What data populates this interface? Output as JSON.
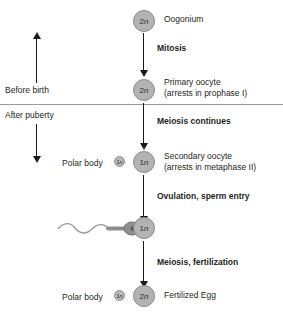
{
  "diagram": {
    "background": "#ffffff",
    "cell_fill": "#b3b3b3",
    "cell_stroke": "#8a8a8a",
    "arrow_color": "#1a1a1a",
    "divider_color": "#9b9b9b"
  },
  "phases": {
    "before_birth": "Before birth",
    "after_puberty": "After puberty"
  },
  "steps": {
    "mitosis": "Mitosis",
    "meiosis_continues": "Meiosis continues",
    "ovulation": "Ovulation, sperm entry",
    "meiosis_fertilization": "Meiosis, fertilization"
  },
  "cells": {
    "oogonium": {
      "ploidy": "2n",
      "name": "Oogonium",
      "note": ""
    },
    "primary_oocyte": {
      "ploidy": "2n",
      "name": "Primary oocyte",
      "note": "(arrests in prophase I)"
    },
    "secondary_oocyte": {
      "ploidy": "1n",
      "name": "Secondary oocyte",
      "note": "(arrests in metaphase II)"
    },
    "fertilized_oocyte": {
      "ploidy": "1n",
      "name": "",
      "note": ""
    },
    "fertilized_egg": {
      "ploidy": "2n",
      "name": "Fertilized Egg",
      "note": ""
    }
  },
  "polar_bodies": {
    "first": {
      "label": "Polar body",
      "ploidy": "1n"
    },
    "second": {
      "label": "Polar body",
      "ploidy": "1n"
    }
  },
  "icons": {
    "sperm": "sperm-cell",
    "arrow_down": "arrow-down-icon",
    "arrow_up": "arrow-up-icon"
  }
}
